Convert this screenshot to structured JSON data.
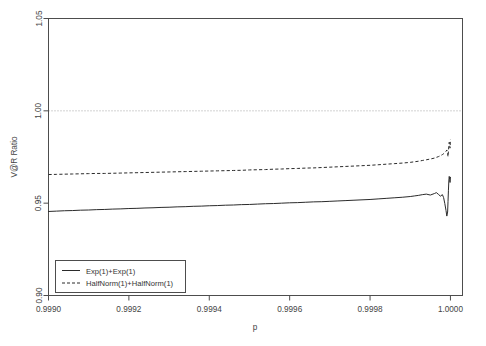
{
  "chart_data": {
    "type": "line",
    "title": "",
    "xlabel": "p",
    "ylabel": "V@R Ratio",
    "xlim": [
      0.999,
      1.00003
    ],
    "ylim": [
      0.9,
      1.05
    ],
    "xticks": [
      0.999,
      0.9992,
      0.9994,
      0.9996,
      0.9998,
      1.0
    ],
    "xticklabels": [
      "0.9990",
      "0.9992",
      "0.9994",
      "0.9996",
      "0.9998",
      "1.0000"
    ],
    "yticks": [
      0.9,
      0.95,
      1.0,
      1.05
    ],
    "yticklabels": [
      "0.90",
      "0.95",
      "1.00",
      "1.05"
    ],
    "grid": false,
    "reference_lines": [
      {
        "axis": "y",
        "value": 1.0,
        "style": "dotted",
        "color": "#9a9a9a"
      }
    ],
    "legend": {
      "position": "bottom-left",
      "entries": [
        {
          "label": "Exp(1)+Exp(1)",
          "style": "solid"
        },
        {
          "label": "HalfNorm(1)+HalfNorm(1)",
          "style": "dashed"
        }
      ]
    },
    "series": [
      {
        "name": "Exp(1)+Exp(1)",
        "style": "solid",
        "x": [
          0.999,
          0.99902,
          0.99904,
          0.99906,
          0.99908,
          0.9991,
          0.99912,
          0.99914,
          0.99916,
          0.99918,
          0.9992,
          0.99922,
          0.99924,
          0.99926,
          0.99928,
          0.9993,
          0.99932,
          0.99934,
          0.99936,
          0.99938,
          0.9994,
          0.99942,
          0.99944,
          0.99946,
          0.99948,
          0.9995,
          0.99952,
          0.99954,
          0.99956,
          0.99958,
          0.9996,
          0.99962,
          0.99964,
          0.99966,
          0.99968,
          0.9997,
          0.99972,
          0.99974,
          0.99976,
          0.99978,
          0.9998,
          0.99982,
          0.99984,
          0.99986,
          0.99988,
          0.9999,
          0.99991,
          0.99992,
          0.99993,
          0.99994,
          0.99995,
          0.99996,
          0.999965,
          0.99997,
          0.999975,
          0.99998,
          0.999983,
          0.999986,
          0.999989,
          0.999991,
          0.999993,
          0.999994,
          0.999995,
          0.999996,
          0.999997,
          0.999998,
          0.999999,
          1.0
        ],
        "y": [
          0.9455,
          0.9457,
          0.9459,
          0.946,
          0.9462,
          0.9463,
          0.9465,
          0.9466,
          0.9468,
          0.9469,
          0.9471,
          0.9472,
          0.9474,
          0.9475,
          0.9477,
          0.9478,
          0.948,
          0.9481,
          0.9483,
          0.9484,
          0.9486,
          0.9487,
          0.9489,
          0.949,
          0.9492,
          0.9493,
          0.9495,
          0.9497,
          0.9498,
          0.95,
          0.9502,
          0.9503,
          0.9505,
          0.9507,
          0.9508,
          0.951,
          0.9512,
          0.9514,
          0.9516,
          0.9518,
          0.952,
          0.9523,
          0.9526,
          0.9529,
          0.9532,
          0.9536,
          0.9539,
          0.9542,
          0.9546,
          0.9549,
          0.9544,
          0.9552,
          0.9557,
          0.9548,
          0.9538,
          0.9546,
          0.953,
          0.9498,
          0.946,
          0.943,
          0.9452,
          0.951,
          0.957,
          0.962,
          0.9645,
          0.9628,
          0.9612,
          0.964
        ]
      },
      {
        "name": "HalfNorm(1)+HalfNorm(1)",
        "style": "dashed",
        "x": [
          0.999,
          0.99902,
          0.99904,
          0.99906,
          0.99908,
          0.9991,
          0.99912,
          0.99914,
          0.99916,
          0.99918,
          0.9992,
          0.99922,
          0.99924,
          0.99926,
          0.99928,
          0.9993,
          0.99932,
          0.99934,
          0.99936,
          0.99938,
          0.9994,
          0.99942,
          0.99944,
          0.99946,
          0.99948,
          0.9995,
          0.99952,
          0.99954,
          0.99956,
          0.99958,
          0.9996,
          0.99962,
          0.99964,
          0.99966,
          0.99968,
          0.9997,
          0.99972,
          0.99974,
          0.99976,
          0.99978,
          0.9998,
          0.99982,
          0.99984,
          0.99986,
          0.99988,
          0.9999,
          0.99991,
          0.99992,
          0.99993,
          0.99994,
          0.99995,
          0.99996,
          0.999965,
          0.99997,
          0.999975,
          0.99998,
          0.999983,
          0.999986,
          0.999989,
          0.999991,
          0.999993,
          0.999994,
          0.999995,
          0.999996,
          0.999997,
          0.999998,
          0.999999,
          1.0
        ],
        "y": [
          0.9655,
          0.9656,
          0.9657,
          0.9658,
          0.9659,
          0.966,
          0.9661,
          0.9661,
          0.9662,
          0.9663,
          0.9664,
          0.9665,
          0.9666,
          0.9667,
          0.9668,
          0.9669,
          0.967,
          0.9671,
          0.9672,
          0.9673,
          0.9674,
          0.9675,
          0.9676,
          0.9677,
          0.9678,
          0.968,
          0.9681,
          0.9682,
          0.9684,
          0.9685,
          0.9687,
          0.9688,
          0.969,
          0.9691,
          0.9693,
          0.9695,
          0.9697,
          0.9699,
          0.9701,
          0.9703,
          0.9705,
          0.9708,
          0.9711,
          0.9714,
          0.9717,
          0.9721,
          0.9724,
          0.9727,
          0.9731,
          0.9735,
          0.9739,
          0.9744,
          0.9748,
          0.9752,
          0.9757,
          0.9763,
          0.9768,
          0.9774,
          0.9781,
          0.9788,
          0.977,
          0.9752,
          0.9782,
          0.981,
          0.983,
          0.9815,
          0.9798,
          0.9845
        ]
      }
    ]
  }
}
